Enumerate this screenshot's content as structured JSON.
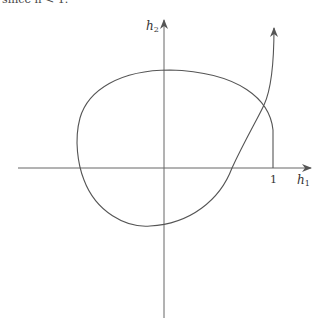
{
  "header": {
    "cropped_text": "since h < 1."
  },
  "diagram": {
    "axes": {
      "x_label": "h",
      "x_label_sub": "1",
      "y_label": "h",
      "y_label_sub": "2",
      "x_tick_label": "1"
    },
    "curves": [
      {
        "name": "closed-loop-curve",
        "description": "closed curve crossing both axes, meeting vertical line at h1=1"
      },
      {
        "name": "open-curve",
        "description": "curve rising from the positive h1 axis with arrow upward near h1=1"
      }
    ],
    "colors": {
      "stroke": "#555555",
      "text": "#333333",
      "background": "#ffffff"
    }
  }
}
